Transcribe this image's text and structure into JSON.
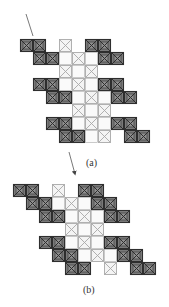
{
  "colors": {
    "dark_fill": "#7d7d7d",
    "dark_inner": "#8f8f8f",
    "dark_stroke": "#2e2e2e",
    "light_fill": "#f4f4f4",
    "light_stroke": "#a8a8a8",
    "line": "#555555"
  },
  "cell_size": 13,
  "diagrams": [
    {
      "id": "a",
      "label": "(a)",
      "origin": [
        20,
        39
      ],
      "label_pos": [
        86,
        157
      ],
      "rows": [
        {
          "dark": [
            0,
            1,
            5,
            6
          ],
          "lightX": [
            3
          ],
          "blank": []
        },
        {
          "dark": [
            1,
            2,
            6,
            7
          ],
          "lightX": [
            4
          ],
          "blank": [
            3,
            5
          ]
        },
        {
          "dark": [],
          "lightX": [
            3,
            5
          ],
          "blank": [
            4
          ]
        },
        {
          "dark": [
            1,
            2,
            6,
            7
          ],
          "lightX": [
            4
          ],
          "blank": [
            3,
            5
          ]
        },
        {
          "dark": [
            2,
            3,
            7,
            8
          ],
          "lightX": [
            5
          ],
          "blank": [
            4,
            6
          ]
        },
        {
          "dark": [],
          "lightX": [
            4,
            6
          ],
          "blank": [
            5
          ]
        },
        {
          "dark": [
            2,
            3,
            7,
            8
          ],
          "lightX": [
            5
          ],
          "blank": [
            4,
            6
          ]
        },
        {
          "dark": [
            3,
            4,
            8,
            9
          ],
          "lightX": [
            6
          ],
          "blank": [
            5
          ]
        }
      ]
    },
    {
      "id": "b",
      "label": "(b)",
      "origin": [
        13,
        184
      ],
      "label_pos": [
        83,
        284
      ],
      "rows": [
        {
          "dark": [
            0,
            1,
            5,
            6
          ],
          "lightX": [
            3
          ],
          "blank": []
        },
        {
          "dark": [
            1,
            2,
            6,
            7
          ],
          "lightX": [
            4
          ],
          "blank": [
            3,
            5
          ]
        },
        {
          "dark": [
            2,
            3,
            7,
            8
          ],
          "lightX": [
            5
          ],
          "blank": [
            4,
            6
          ]
        },
        {
          "dark": [],
          "lightX": [
            4,
            6
          ],
          "blank": [
            5
          ]
        },
        {
          "dark": [
            2,
            3,
            7,
            8
          ],
          "lightX": [
            5
          ],
          "blank": [
            4,
            6
          ]
        },
        {
          "dark": [
            3,
            4,
            8,
            9
          ],
          "lightX": [
            6
          ],
          "blank": [
            5,
            7
          ]
        },
        {
          "dark": [
            4,
            5,
            9,
            10
          ],
          "lightX": [
            7
          ],
          "blank": []
        }
      ]
    }
  ],
  "lines": [
    {
      "name": "pointer-line-top",
      "x1": 26,
      "y1": 14,
      "x2": 33,
      "y2": 36,
      "arrow": false
    },
    {
      "name": "arrow-a-to-b",
      "x1": 69,
      "y1": 152,
      "x2": 75,
      "y2": 174,
      "arrow": true
    }
  ]
}
